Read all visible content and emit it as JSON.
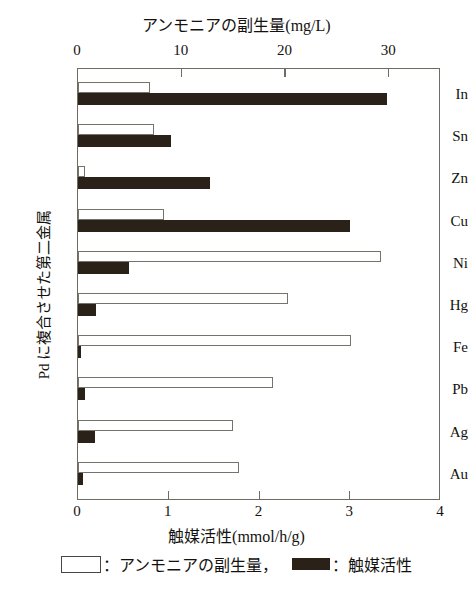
{
  "chart_data": {
    "type": "bar",
    "orientation": "horizontal",
    "title": "アンモニアの副生量(mg/L)",
    "xlabel_top": "アンモニアの副生量(mg/L)",
    "xlabel_bottom": "触媒活性(mmol/h/g)",
    "ylabel": "Pd に複合させた第二金属",
    "categories": [
      "In",
      "Sn",
      "Zn",
      "Cu",
      "Ni",
      "Hg",
      "Fe",
      "Pb",
      "Ag",
      "Au"
    ],
    "series": [
      {
        "name": "アンモニアの副生量",
        "unit": "mg/L",
        "axis": "top",
        "style": "open",
        "axis_range": [
          0,
          35
        ],
        "values": [
          6.9,
          7.3,
          0.7,
          8.3,
          29.2,
          20.2,
          26.3,
          18.8,
          14.9,
          15.5
        ]
      },
      {
        "name": "触媒活性",
        "unit": "mmol/h/g",
        "axis": "bottom",
        "style": "filled",
        "axis_range": [
          0,
          4
        ],
        "values": [
          3.4,
          1.02,
          1.45,
          3.0,
          0.56,
          0.2,
          0.03,
          0.08,
          0.19,
          0.05
        ]
      }
    ],
    "top_axis": {
      "ticks": [
        0,
        10,
        20,
        30
      ],
      "tick_labels": [
        "0",
        "10",
        "20",
        "30"
      ],
      "min": 0,
      "max": 35
    },
    "bottom_axis": {
      "ticks": [
        0,
        1,
        2,
        3,
        4
      ],
      "tick_labels": [
        "0",
        "1",
        "2",
        "3",
        "4"
      ],
      "min": 0,
      "max": 4
    },
    "grid": false,
    "legend": {
      "position": "bottom",
      "entries": [
        {
          "swatch": "open",
          "label": "：アンモニアの副生量，"
        },
        {
          "swatch": "filled",
          "label": "：触媒活性"
        }
      ]
    },
    "colors": {
      "filled_bar": "#2a2118",
      "open_bar_border": "#75736a",
      "axis": "#6f6c63",
      "background": "#ffffff"
    }
  }
}
